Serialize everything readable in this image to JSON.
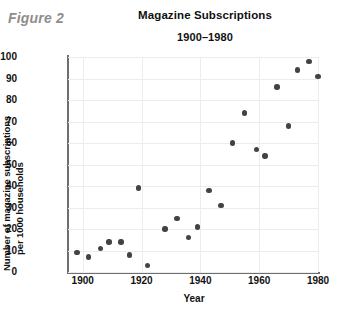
{
  "figure": {
    "label": "Figure 2"
  },
  "chart_data": {
    "type": "scatter",
    "title": "Magazine Subscriptions",
    "subtitle": "1900–1980",
    "xlabel": "Year",
    "ylabel": "Number of magazine subscriptions per 1000 households",
    "ylabel_line1": "Number of magazine subscriptions",
    "ylabel_line2": "per 1000 households",
    "xlim": [
      1895,
      1980
    ],
    "ylim": [
      0,
      100
    ],
    "xticks": [
      "1900",
      "1920",
      "1940",
      "1960",
      "1980"
    ],
    "xtick_values": [
      1900,
      1920,
      1940,
      1960,
      1980
    ],
    "yticks": [
      "0",
      "10",
      "20",
      "30",
      "40",
      "50",
      "60",
      "70",
      "80",
      "90",
      "100"
    ],
    "ytick_values": [
      0,
      10,
      20,
      30,
      40,
      50,
      60,
      70,
      80,
      90,
      100
    ],
    "grid": true,
    "legend": false,
    "marker_color": "#434343",
    "points": [
      {
        "x": 1898,
        "y": 9
      },
      {
        "x": 1902,
        "y": 7
      },
      {
        "x": 1906,
        "y": 11
      },
      {
        "x": 1909,
        "y": 14
      },
      {
        "x": 1913,
        "y": 14
      },
      {
        "x": 1916,
        "y": 8
      },
      {
        "x": 1919,
        "y": 39
      },
      {
        "x": 1922,
        "y": 3
      },
      {
        "x": 1928,
        "y": 20
      },
      {
        "x": 1932,
        "y": 25
      },
      {
        "x": 1936,
        "y": 16
      },
      {
        "x": 1939,
        "y": 21
      },
      {
        "x": 1943,
        "y": 38
      },
      {
        "x": 1947,
        "y": 31
      },
      {
        "x": 1951,
        "y": 60
      },
      {
        "x": 1955,
        "y": 74
      },
      {
        "x": 1959,
        "y": 57
      },
      {
        "x": 1962,
        "y": 54
      },
      {
        "x": 1966,
        "y": 86
      },
      {
        "x": 1970,
        "y": 68
      },
      {
        "x": 1973,
        "y": 94
      },
      {
        "x": 1977,
        "y": 98
      },
      {
        "x": 1980,
        "y": 91
      }
    ]
  }
}
